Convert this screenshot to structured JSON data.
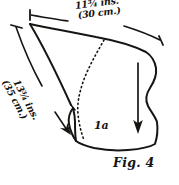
{
  "figure": {
    "caption": "Fig. 4",
    "piece_label": "1a",
    "background_color": "#ffffff",
    "ink_color": "#171512"
  },
  "dimensions": {
    "top": {
      "name": "top-width",
      "imperial": "11¾ ins.",
      "metric": "(30 cm.)",
      "value_inches": 11.75,
      "value_cm": 30
    },
    "diagonal": {
      "name": "diagonal-length",
      "imperial": "13¾ ins.",
      "metric": "(35 cm.)",
      "value_inches": 13.75,
      "value_cm": 35
    }
  },
  "annotations": {
    "grain_arrow": "downward-grain-arrow",
    "fold_line": "dotted-fold-curve"
  }
}
